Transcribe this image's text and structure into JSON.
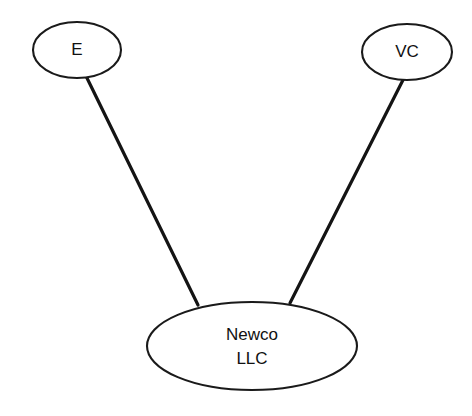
{
  "diagram": {
    "type": "entity-ownership-diagram",
    "background_color": "#ffffff",
    "stroke_color": "#1a1a1a",
    "edge_color": "#141414",
    "text_color": "#111111",
    "nodes": [
      {
        "id": "E",
        "label": "E",
        "shape": "ellipse",
        "cx": 77,
        "cy": 50,
        "rx": 44,
        "ry": 28
      },
      {
        "id": "VC",
        "label": "VC",
        "shape": "ellipse",
        "cx": 407,
        "cy": 52,
        "rx": 45,
        "ry": 28
      },
      {
        "id": "NEWCO",
        "label_line1": "Newco",
        "label_line2": "LLC",
        "shape": "ellipse",
        "cx": 252,
        "cy": 346,
        "rx": 105,
        "ry": 44
      }
    ],
    "edges": [
      {
        "id": "edge-e-newco",
        "from": "E",
        "to": "NEWCO",
        "x1": 86,
        "y1": 76,
        "x2": 198,
        "y2": 305
      },
      {
        "id": "edge-vc-newco",
        "from": "VC",
        "to": "NEWCO",
        "x1": 404,
        "y1": 78,
        "x2": 290,
        "y2": 303
      }
    ]
  }
}
